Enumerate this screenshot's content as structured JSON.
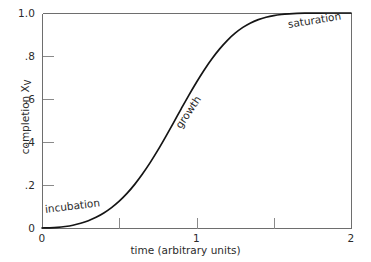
{
  "chart_data": {
    "type": "line",
    "title": "",
    "xlabel": "time (arbitrary units)",
    "ylabel_text": "completion X",
    "ylabel_sub": "V",
    "xlim": [
      0,
      2
    ],
    "ylim": [
      0,
      1.0
    ],
    "grid": false,
    "legend": "none",
    "xticks": [
      0,
      0.5,
      1,
      1.5,
      2
    ],
    "xtick_labels": [
      "0",
      "",
      "1",
      "",
      "2"
    ],
    "yticks": [
      0,
      0.2,
      0.4,
      0.6,
      0.8,
      1.0
    ],
    "ytick_labels": [
      "0",
      ".2",
      ".4",
      ".6",
      ".8",
      "1.0"
    ],
    "series": [
      {
        "name": "completion fraction",
        "x": [
          0.0,
          0.05,
          0.1,
          0.15,
          0.2,
          0.25,
          0.3,
          0.35,
          0.4,
          0.45,
          0.5,
          0.55,
          0.6,
          0.65,
          0.7,
          0.75,
          0.8,
          0.85,
          0.9,
          0.95,
          1.0,
          1.05,
          1.1,
          1.15,
          1.2,
          1.25,
          1.3,
          1.35,
          1.4,
          1.45,
          1.5,
          1.55,
          1.6,
          1.65,
          1.7,
          1.75,
          1.8,
          1.85,
          1.9,
          1.95,
          2.0
        ],
        "y": [
          0.0,
          0.001,
          0.003,
          0.007,
          0.013,
          0.022,
          0.034,
          0.05,
          0.07,
          0.095,
          0.125,
          0.161,
          0.203,
          0.251,
          0.304,
          0.362,
          0.424,
          0.488,
          0.553,
          0.617,
          0.678,
          0.735,
          0.787,
          0.833,
          0.873,
          0.906,
          0.933,
          0.954,
          0.969,
          0.98,
          0.988,
          0.993,
          0.996,
          0.998,
          0.999,
          0.9995,
          0.9998,
          0.9999,
          1.0,
          1.0,
          1.0
        ]
      }
    ],
    "annotations": [
      {
        "text": "incubation",
        "x": 0.02,
        "y": 0.09,
        "rotation": -7
      },
      {
        "text": "growth",
        "x": 0.88,
        "y": 0.47,
        "rotation": -56
      },
      {
        "text": "saturation",
        "x": 1.59,
        "y": 0.95,
        "rotation": -9
      }
    ]
  },
  "axes_geometry": {
    "left_px": 42,
    "right_px": 351,
    "top_px": 13,
    "bottom_px": 228
  },
  "colors": {
    "curve": "#151515",
    "axis": "#6e6e6e",
    "tick": "#8a8a8a",
    "text": "#2b2b2b",
    "background": "#ffffff"
  }
}
